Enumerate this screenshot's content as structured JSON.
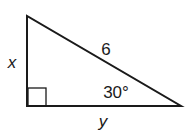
{
  "diagram": {
    "type": "right-triangle",
    "colors": {
      "stroke": "#1a1a1a",
      "background": "#ffffff"
    },
    "vertices": {
      "top": [
        27,
        16
      ],
      "right_angle": [
        27,
        106
      ],
      "acute": [
        181,
        106
      ]
    },
    "right_angle_marker": {
      "x": 28,
      "y": 88,
      "size": 18
    },
    "labels": {
      "vertical_leg": "x",
      "horizontal_leg": "y",
      "hypotenuse": "6",
      "angle": "30°"
    }
  }
}
